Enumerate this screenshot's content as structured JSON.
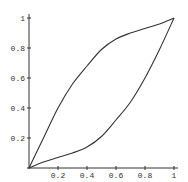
{
  "chart_data": {
    "type": "line",
    "title": "",
    "xlabel": "",
    "ylabel": "",
    "xlim": [
      0,
      1
    ],
    "ylim": [
      0,
      1
    ],
    "grid": false,
    "legend": null,
    "x_ticks": [
      "0.2",
      "0.4",
      "0.6",
      "0.8",
      "1"
    ],
    "y_ticks": [
      "0.2",
      "0.4",
      "0.6",
      "0.8",
      "1"
    ],
    "series": [
      {
        "name": "upper curve",
        "x": [
          0,
          0.1,
          0.2,
          0.3,
          0.4,
          0.5,
          0.6,
          0.7,
          0.8,
          0.9,
          1.0
        ],
        "y": [
          0,
          0.2,
          0.4,
          0.56,
          0.68,
          0.79,
          0.86,
          0.9,
          0.93,
          0.96,
          1.0
        ]
      },
      {
        "name": "lower curve",
        "x": [
          0,
          0.1,
          0.2,
          0.3,
          0.4,
          0.5,
          0.6,
          0.7,
          0.8,
          0.9,
          1.0
        ],
        "y": [
          0,
          0.04,
          0.07,
          0.1,
          0.14,
          0.21,
          0.32,
          0.44,
          0.6,
          0.79,
          1.0
        ]
      }
    ]
  },
  "axes": {
    "x_tick_labels": [
      "0.2",
      "0.4",
      "0.6",
      "0.8",
      "1"
    ],
    "y_tick_labels": [
      "0.2",
      "0.4",
      "0.6",
      "0.8",
      "1"
    ]
  }
}
